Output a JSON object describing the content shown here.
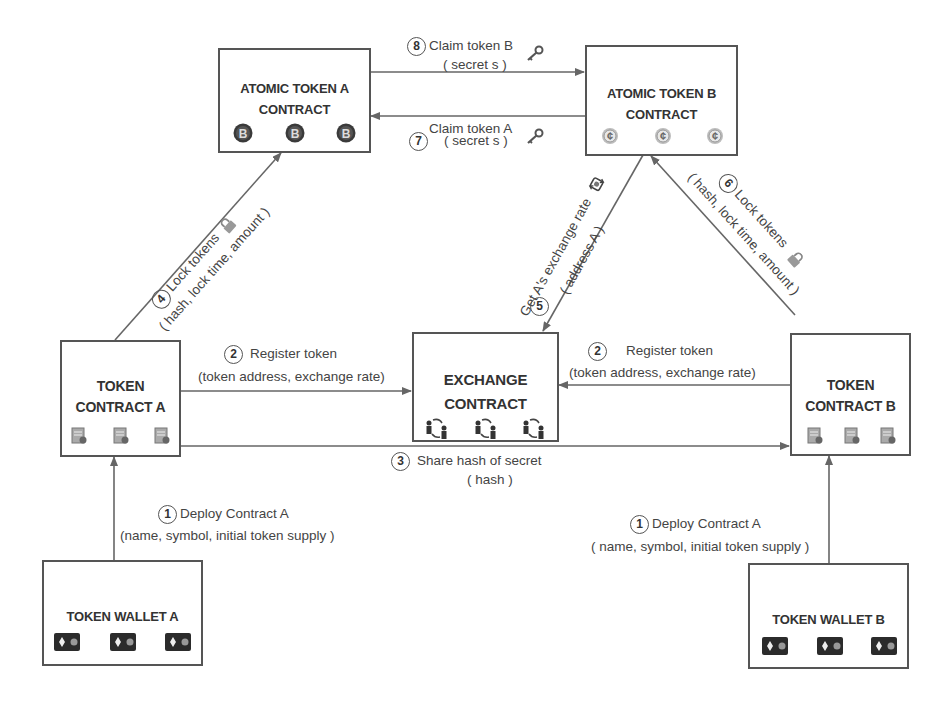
{
  "diagram": {
    "colors": {
      "line": "#666666",
      "box_border": "#555555",
      "text": "#3a3a3a",
      "icon_dark": "#2b2b2b",
      "icon_gray": "#8a8a8a"
    }
  },
  "nodes": {
    "atomic_a": {
      "line1": "ATOMIC TOKEN A",
      "line2": "CONTRACT",
      "icon": "bitcoin-coin-icon",
      "icon_count": 3
    },
    "atomic_b": {
      "line1": "ATOMIC TOKEN B",
      "line2": "CONTRACT",
      "icon": "cent-coin-icon",
      "icon_count": 3
    },
    "token_contract_a": {
      "line1": "TOKEN",
      "line2": "CONTRACT A",
      "icon": "contract-document-icon",
      "icon_count": 3
    },
    "exchange": {
      "line1": "EXCHANGE",
      "line2": "CONTRACT",
      "icon": "people-exchange-icon",
      "icon_count": 3
    },
    "token_contract_b": {
      "line1": "TOKEN",
      "line2": "CONTRACT B",
      "icon": "contract-document-icon",
      "icon_count": 3
    },
    "wallet_a": {
      "label": "TOKEN WALLET A",
      "icon": "wallet-icon",
      "icon_count": 3
    },
    "wallet_b": {
      "label": "TOKEN WALLET B",
      "icon": "wallet-icon",
      "icon_count": 3
    }
  },
  "edges": [
    {
      "step": "1",
      "from": "wallet_a",
      "to": "token_contract_a",
      "label": "Deploy Contract A",
      "params": "(name, symbol, initial token supply )"
    },
    {
      "step": "1",
      "from": "wallet_b",
      "to": "token_contract_b",
      "label": "Deploy Contract A",
      "params": "( name, symbol, initial token supply )"
    },
    {
      "step": "2",
      "from": "token_contract_a",
      "to": "exchange",
      "label": "Register token",
      "params": "(token address, exchange rate)"
    },
    {
      "step": "2",
      "from": "token_contract_b",
      "to": "exchange",
      "label": "Register token",
      "params": "(token address, exchange rate)"
    },
    {
      "step": "3",
      "from": "token_contract_a",
      "to": "token_contract_b",
      "label": "Share hash of secret",
      "params": "( hash )"
    },
    {
      "step": "4",
      "from": "token_contract_a",
      "to": "atomic_a",
      "label": "Lock tokens",
      "params": "( hash, lock time, amount )",
      "icon": "padlock-icon"
    },
    {
      "step": "5",
      "from": "atomic_b",
      "to": "exchange",
      "label": "Get A's  exchange rate",
      "params": "( address A )",
      "icon": "exchange-rate-icon"
    },
    {
      "step": "6",
      "from": "token_contract_b",
      "to": "atomic_b",
      "label": "Lock tokens",
      "params": "( hash, lock time, amount )",
      "icon": "padlock-icon"
    },
    {
      "step": "7",
      "from": "atomic_b",
      "to": "atomic_a",
      "label": "Claim token A",
      "params": "( secret s )",
      "icon": "key-icon"
    },
    {
      "step": "8",
      "from": "atomic_a",
      "to": "atomic_b",
      "label": "Claim token B",
      "params": "( secret s )",
      "icon": "key-icon"
    }
  ]
}
